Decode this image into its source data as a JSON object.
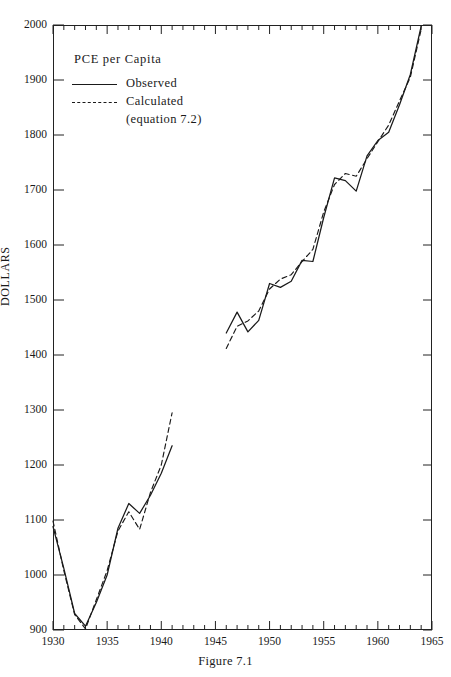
{
  "caption": "Figure 7.1",
  "header_remnant": "",
  "legend": {
    "title": "PCE  per  Capita",
    "entries": [
      {
        "label": "Observed",
        "style": "solid",
        "sub": ""
      },
      {
        "label": "Calculated",
        "style": "dashed",
        "sub": "(equation 7.2)"
      }
    ]
  },
  "axes": {
    "ylabel": "DOLLARS",
    "xlabel": "",
    "y_ticks": [
      900,
      1000,
      1100,
      1200,
      1300,
      1400,
      1500,
      1600,
      1700,
      1800,
      1900,
      2000
    ],
    "x_ticks": [
      1930,
      1935,
      1940,
      1945,
      1950,
      1955,
      1960,
      1965
    ],
    "x_minor_step": 1,
    "xlim": [
      1930,
      1965
    ],
    "ylim": [
      900,
      2000
    ]
  },
  "colors": {
    "line": "#1a1a1a",
    "frame": "#222222",
    "background": "#ffffff"
  },
  "chart_data": {
    "type": "line",
    "title": "",
    "subtitle": "",
    "xlabel": "",
    "ylabel": "DOLLARS",
    "xlim": [
      1930,
      1965
    ],
    "ylim": [
      900,
      2000
    ],
    "grid": false,
    "legend_position": "upper-left",
    "annotations": [
      "PCE  per  Capita",
      "Figure 7.1"
    ],
    "series": [
      {
        "name": "Observed",
        "style": "solid",
        "segments": [
          {
            "x": [
              1930,
              1931,
              1932,
              1933,
              1934,
              1935,
              1936,
              1937,
              1938,
              1939,
              1940,
              1941
            ],
            "y": [
              1088,
              1012,
              930,
              907,
              950,
              1000,
              1085,
              1130,
              1112,
              1145,
              1185,
              1235
            ]
          },
          {
            "x": [
              1946,
              1947,
              1948,
              1949,
              1950,
              1951,
              1952,
              1953,
              1954,
              1955,
              1956,
              1957,
              1958,
              1959,
              1960,
              1961,
              1962,
              1963,
              1964
            ],
            "y": [
              1440,
              1478,
              1442,
              1463,
              1530,
              1523,
              1534,
              1572,
              1570,
              1650,
              1722,
              1717,
              1698,
              1762,
              1790,
              1805,
              1855,
              1910,
              1998
            ]
          }
        ]
      },
      {
        "name": "Calculated (equation 7.2)",
        "style": "dashed",
        "segments": [
          {
            "x": [
              1930,
              1931,
              1932,
              1933,
              1934,
              1935,
              1936,
              1937,
              1938,
              1939,
              1940,
              1941
            ],
            "y": [
              1098,
              1008,
              928,
              902,
              955,
              1008,
              1080,
              1115,
              1083,
              1150,
              1200,
              1295
            ]
          },
          {
            "x": [
              1946,
              1947,
              1948,
              1949,
              1950,
              1951,
              1952,
              1953,
              1954,
              1955,
              1956,
              1957,
              1958,
              1959,
              1960,
              1961,
              1962,
              1963,
              1964
            ],
            "y": [
              1412,
              1452,
              1462,
              1480,
              1520,
              1538,
              1546,
              1570,
              1592,
              1660,
              1710,
              1730,
              1725,
              1757,
              1788,
              1818,
              1862,
              1905,
              1992
            ]
          }
        ]
      }
    ]
  }
}
